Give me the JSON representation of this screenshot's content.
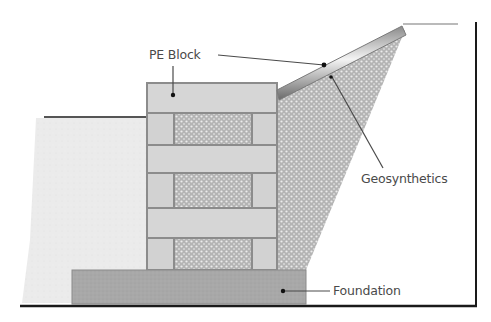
{
  "diagram": {
    "labels": {
      "pe_block": "PE Block",
      "geosynthetics": "Geosynthetics",
      "foundation": "Foundation"
    },
    "components": [
      {
        "id": "retained-soil",
        "description": "Light gray fill in front of wall"
      },
      {
        "id": "pe-block-wall",
        "description": "Stacked PE blocks, alternating solid and hollow (stippled) courses"
      },
      {
        "id": "backfill",
        "description": "Stippled wedge behind wall"
      },
      {
        "id": "geosynthetics",
        "description": "Inclined reinforcement strip from wall top to slope crest"
      },
      {
        "id": "foundation",
        "description": "Darker gray base slab under wall"
      }
    ],
    "colors": {
      "soil": "#ececec",
      "block": "#d4d4d4",
      "block_edge": "#8c8c8c",
      "stipple_bg": "#b8b8b8",
      "stipple_dot": "#e6e6e6",
      "foundation": "#a9a9a9",
      "line": "#3a3a3a",
      "frame": "#1a1a1a",
      "text": "#4a4a4a"
    }
  }
}
